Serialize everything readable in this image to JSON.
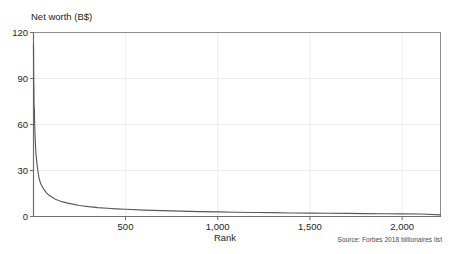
{
  "chart_data": {
    "type": "line",
    "title": "",
    "xlabel": "Rank",
    "ylabel": "Net worth (B$)",
    "ylabel_full": "Net worth (B$)",
    "source_note": "Source: Forbes 2018 billionaires list",
    "xlim": [
      1,
      2208
    ],
    "ylim": [
      0,
      120
    ],
    "grid": true,
    "grid_axes": "both",
    "legend": "none",
    "line_color": "#58595b",
    "grid_color": "#e8e8e8",
    "axis_color": "#808285",
    "yticks": [
      0,
      30,
      60,
      90,
      120
    ],
    "ytick_labels": [
      "0",
      "30",
      "60",
      "90",
      "120"
    ],
    "xticks": [
      500,
      1000,
      1500,
      2000
    ],
    "xtick_labels": [
      "500",
      "1,000",
      "1,500",
      "2,000"
    ],
    "series": [
      {
        "name": "Net worth by rank",
        "x": [
          1,
          2,
          3,
          4,
          5,
          6,
          7,
          8,
          9,
          10,
          12,
          15,
          18,
          20,
          25,
          30,
          35,
          40,
          50,
          60,
          70,
          80,
          90,
          100,
          120,
          140,
          160,
          180,
          200,
          250,
          300,
          350,
          400,
          450,
          500,
          600,
          700,
          800,
          900,
          1000,
          1100,
          1200,
          1300,
          1400,
          1500,
          1600,
          1700,
          1800,
          1900,
          2000,
          2100,
          2208
        ],
        "y": [
          112,
          90,
          84,
          72,
          71,
          70,
          60,
          58.5,
          53.8,
          51.3,
          46,
          40,
          36.6,
          34,
          29.7,
          25.5,
          23.3,
          21.5,
          19.1,
          17.2,
          15.6,
          14.4,
          13.5,
          12.7,
          11.3,
          10.3,
          9.5,
          8.9,
          8.4,
          7.2,
          6.4,
          5.8,
          5.4,
          5.0,
          4.7,
          4.2,
          3.8,
          3.5,
          3.2,
          3.0,
          2.8,
          2.6,
          2.5,
          2.3,
          2.2,
          2.1,
          2.0,
          1.9,
          1.8,
          1.7,
          1.6,
          1.1
        ]
      }
    ]
  },
  "axes": {
    "y_title": "Net worth (B$)",
    "x_title": "Rank"
  },
  "footer": {
    "source": "Source: Forbes 2018 billionaires list"
  }
}
